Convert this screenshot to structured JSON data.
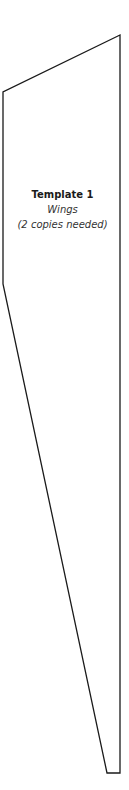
{
  "template": {
    "title": "Template 1",
    "part": "Wings",
    "note": "(2 copies needed)"
  },
  "shape": {
    "points": "120,35 3,92 3,284 107,773 120,773",
    "stroke": "#1a1a1a",
    "fill": "#ffffff"
  }
}
